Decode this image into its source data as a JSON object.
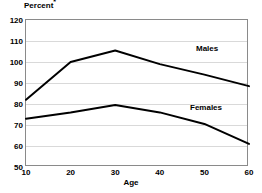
{
  "chart_data": {
    "type": "line",
    "title": "",
    "ylabel": "Percent *",
    "xlabel": "Age",
    "ylim": [
      50,
      120
    ],
    "xlim": [
      10,
      60
    ],
    "grid": true,
    "legend_position": "inline-right",
    "y_ticks": [
      50,
      60,
      70,
      80,
      90,
      100,
      110,
      120
    ],
    "x_ticks": [
      10,
      20,
      30,
      40,
      50,
      60
    ],
    "x": [
      10,
      20,
      30,
      40,
      50,
      60
    ],
    "categories": [
      "10",
      "20",
      "30",
      "40",
      "50",
      "60"
    ],
    "series": [
      {
        "name": "Males",
        "values": [
          82,
          100,
          105.5,
          99,
          94,
          88.5
        ],
        "color": "#000000"
      },
      {
        "name": "Females",
        "values": [
          73,
          76,
          79.5,
          76,
          70.5,
          61
        ],
        "color": "#000000"
      }
    ]
  },
  "axis": {
    "y_title": "Percent",
    "y_title_footnote": "*",
    "x_title": "Age"
  },
  "colors": {
    "line": "#000000",
    "grid": "#d9d9d9",
    "frame": "#8a8a8a",
    "background": "#ffffff"
  }
}
